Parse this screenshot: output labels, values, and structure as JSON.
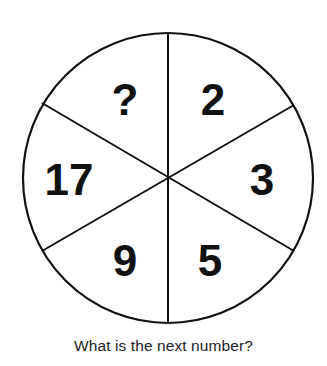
{
  "puzzle": {
    "type": "number-wheel",
    "segments": [
      {
        "position": "top-right",
        "value": "2"
      },
      {
        "position": "right",
        "value": "3"
      },
      {
        "position": "bottom-right",
        "value": "5"
      },
      {
        "position": "bottom-left",
        "value": "9"
      },
      {
        "position": "left",
        "value": "17"
      },
      {
        "position": "top-left",
        "value": "?"
      }
    ],
    "caption": "What is the next number?"
  },
  "colors": {
    "line": "#111111",
    "text": "#111111",
    "background": "#ffffff"
  }
}
